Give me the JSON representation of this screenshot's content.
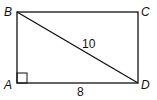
{
  "diagram": {
    "type": "rectangle-with-diagonal",
    "vertices": {
      "A": "A",
      "B": "B",
      "C": "C",
      "D": "D"
    },
    "edges": [
      "AB",
      "BC",
      "CD",
      "DA"
    ],
    "diagonal": {
      "from": "B",
      "to": "D",
      "length_label": "10"
    },
    "bottom_side": {
      "from": "A",
      "to": "D",
      "length_label": "8"
    },
    "right_angle_marker_at": "A",
    "colors": {
      "stroke": "#111111",
      "background": "#ffffff"
    }
  }
}
